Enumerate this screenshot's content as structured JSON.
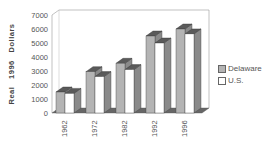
{
  "chart_data": {
    "type": "bar",
    "title": "",
    "xlabel": "",
    "ylabel": "Real 1996 Dollars",
    "ylim": [
      0,
      7000
    ],
    "yticks": [
      0,
      1000,
      2000,
      3000,
      4000,
      5000,
      6000,
      7000
    ],
    "categories": [
      "1962",
      "1972",
      "1982",
      "1992",
      "1996"
    ],
    "series": [
      {
        "name": "Delaware",
        "values": [
          1500,
          2950,
          3550,
          5500,
          6000
        ],
        "color": "#b4b4b4"
      },
      {
        "name": "U.S.",
        "values": [
          1400,
          2600,
          3100,
          5000,
          5650
        ],
        "color": "#ffffff"
      }
    ],
    "grid": false,
    "legend_position": "right",
    "style": "3d-clustered-columns"
  },
  "legend": {
    "items": [
      {
        "label": "Delaware",
        "color": "#b4b4b4"
      },
      {
        "label": "U.S.",
        "color": "#ffffff"
      }
    ]
  }
}
